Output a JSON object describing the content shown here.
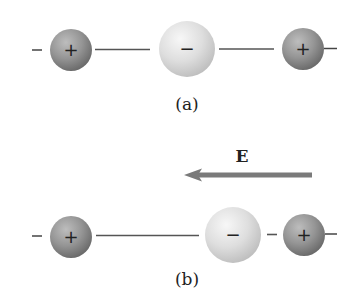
{
  "diagram": {
    "colors": {
      "positive_sphere_light": "#b8b8b8",
      "positive_sphere_dark": "#6e6e6e",
      "negative_sphere_light": "#f2f2f2",
      "negative_sphere_dark": "#c6c6c6",
      "line": "#555555",
      "arrow": "#7a7a7a",
      "text": "#222222"
    },
    "panel_a": {
      "label": "(a)",
      "left_atom_sign": "+",
      "center_atom_sign": "−",
      "right_atom_sign": "+",
      "left_end_sign": "−",
      "right_end_sign": "−"
    },
    "panel_b": {
      "label": "(b)",
      "field_label": "E",
      "field_direction": "left",
      "left_atom_sign": "+",
      "center_atom_sign": "−",
      "right_atom_sign": "+",
      "left_end_sign": "−",
      "right_end_sign": "−"
    }
  }
}
